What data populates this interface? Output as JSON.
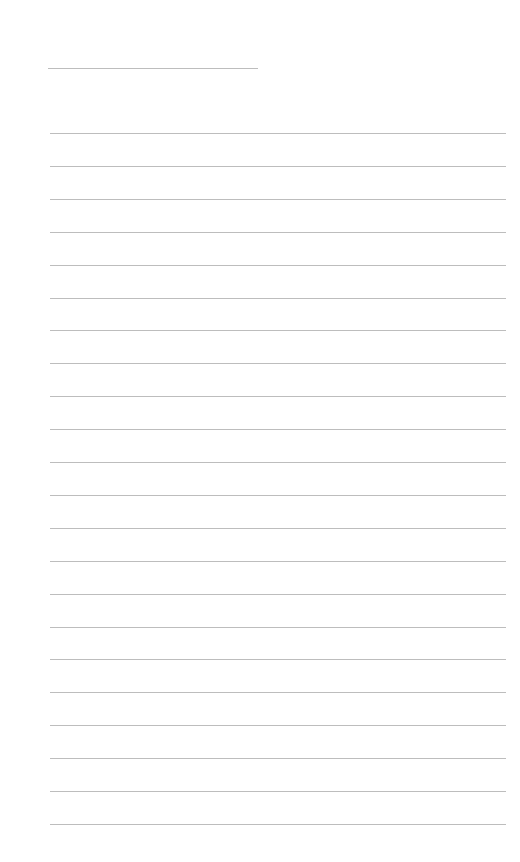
{
  "page": {
    "type": "blank lined sheet",
    "background": "#ffffff",
    "line_color": "#bdbdbd"
  },
  "title_line": {
    "top": 68,
    "left": 48,
    "width": 210
  },
  "ruled_lines": {
    "count": 22,
    "first_top": 133,
    "spacing": 32.9,
    "left": 50,
    "width": 456
  }
}
